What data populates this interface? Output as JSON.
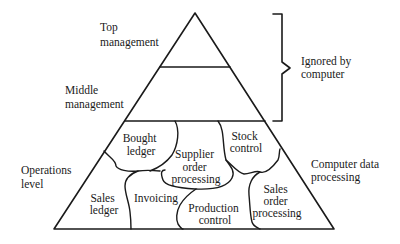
{
  "diagram": {
    "type": "pyramid",
    "levels": [
      {
        "id": "top",
        "label_lines": [
          "Top",
          "management"
        ]
      },
      {
        "id": "middle",
        "label_lines": [
          "Middle",
          "management"
        ]
      },
      {
        "id": "operations",
        "label_lines": [
          "Operations",
          "level"
        ]
      }
    ],
    "bracket": {
      "label_lines": [
        "Ignored by",
        "computer"
      ],
      "spans": [
        "top",
        "middle"
      ]
    },
    "side_label": {
      "label_lines": [
        "Computer data",
        "processing"
      ],
      "applies_to": "operations"
    },
    "operations_regions": [
      {
        "id": "bought-ledger",
        "label_lines": [
          "Bought",
          "ledger"
        ]
      },
      {
        "id": "supplier-order-processing",
        "label_lines": [
          "Supplier",
          "order",
          "processing"
        ]
      },
      {
        "id": "stock-control",
        "label_lines": [
          "Stock",
          "control"
        ]
      },
      {
        "id": "sales-ledger",
        "label_lines": [
          "Sales",
          "ledger"
        ]
      },
      {
        "id": "invoicing",
        "label_lines": [
          "Invoicing"
        ]
      },
      {
        "id": "production-control",
        "label_lines": [
          "Production",
          "control"
        ]
      },
      {
        "id": "sales-order-processing",
        "label_lines": [
          "Sales",
          "order",
          "processing"
        ]
      }
    ]
  }
}
